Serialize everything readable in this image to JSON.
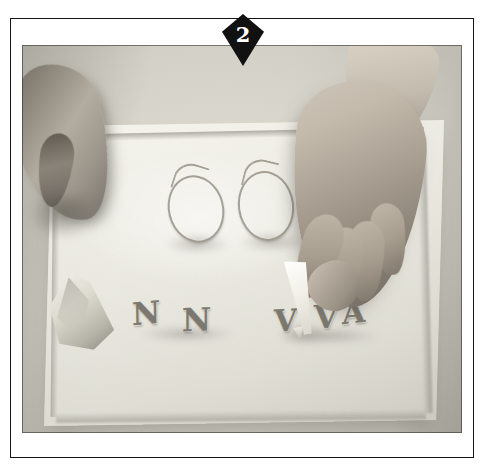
{
  "page": {
    "background_color": "#ffffff"
  },
  "badge": {
    "name": "step-number-badge",
    "shape": "diamond",
    "number": "2",
    "fill_color": "#111111",
    "text_color": "#ffffff"
  },
  "photo": {
    "alt": "Two hands working over a pale acrylic sheet, piping sugar loops and letter shapes",
    "frame_color": "#151515",
    "background_color": "#d2d0c6"
  },
  "scene": {
    "objects": [
      {
        "name": "left-hand",
        "description": "Hand entering from upper left, steadying the sheet"
      },
      {
        "name": "right-hand",
        "description": "Hand at center right holding a paper piping cone"
      },
      {
        "name": "piping-cone-tool",
        "description": "White paper cone with a cut tip"
      },
      {
        "name": "acrylic-sheet",
        "description": "Large pale working sheet"
      },
      {
        "name": "paper-scrap",
        "description": "Crumpled pale paper at lower left"
      }
    ],
    "piped_loops": [
      {
        "name": "loop-left",
        "description": "Teardrop loop"
      },
      {
        "name": "loop-right",
        "description": "Teardrop loop"
      }
    ],
    "piped_letters": [
      "N",
      "N",
      "V",
      "V",
      "A"
    ]
  }
}
